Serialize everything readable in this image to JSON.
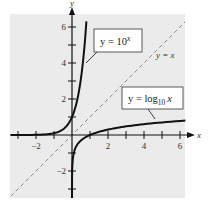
{
  "chart_data": {
    "type": "line",
    "title": "",
    "xlabel": "x",
    "ylabel": "y",
    "xlim": [
      -3.4,
      6.3
    ],
    "ylim": [
      -3.5,
      6.75
    ],
    "grid": false,
    "x_ticks": [
      -3,
      -2,
      -1,
      1,
      2,
      3,
      4,
      5,
      6
    ],
    "x_tick_labels": [
      "-2",
      "2",
      "4",
      "6"
    ],
    "x_tick_label_values": [
      -2,
      2,
      4,
      6
    ],
    "y_ticks": [
      -3,
      -2,
      -1,
      1,
      2,
      3,
      4,
      5,
      6
    ],
    "y_tick_labels": [
      "6",
      "4",
      "2",
      "-2"
    ],
    "y_tick_label_values": [
      6,
      4,
      2,
      -2
    ],
    "series": [
      {
        "name": "y = 10^x",
        "style": "solid",
        "color": "#111111",
        "x": [
          -3.4,
          -2,
          -1,
          -0.5,
          0,
          0.3,
          0.5,
          0.7,
          0.8
        ],
        "y": [
          0.0004,
          0.01,
          0.1,
          0.316,
          1,
          1.995,
          3.162,
          5.012,
          6.31
        ]
      },
      {
        "name": "y = x",
        "style": "dashed",
        "color": "#888888",
        "x": [
          -3.4,
          6.3
        ],
        "y": [
          -3.4,
          6.3
        ]
      },
      {
        "name": "y = log10 x",
        "style": "solid",
        "color": "#111111",
        "x": [
          0.0003,
          0.01,
          0.1,
          0.5,
          1,
          2,
          4,
          6.3
        ],
        "y": [
          -3.5,
          -2,
          -1,
          -0.301,
          0,
          0.301,
          0.602,
          0.799
        ]
      }
    ],
    "annotations": [
      {
        "text": "y = 10^x",
        "box": true
      },
      {
        "text": "y = x",
        "box": false
      },
      {
        "text": "y = log10 x",
        "box": true
      }
    ]
  },
  "labels": {
    "x_axis": "x",
    "y_axis": "y",
    "exp_box": {
      "prefix": "y = 10",
      "sup": "x"
    },
    "identity": "y = x",
    "log_box": {
      "prefix": "y = log",
      "sub": "10",
      "var": "x"
    }
  },
  "colors": {
    "background": "#ffffff",
    "plot_area": "#ebebeb",
    "curve": "#111111",
    "dashed": "#8a8a8a",
    "axis": "#111111"
  }
}
